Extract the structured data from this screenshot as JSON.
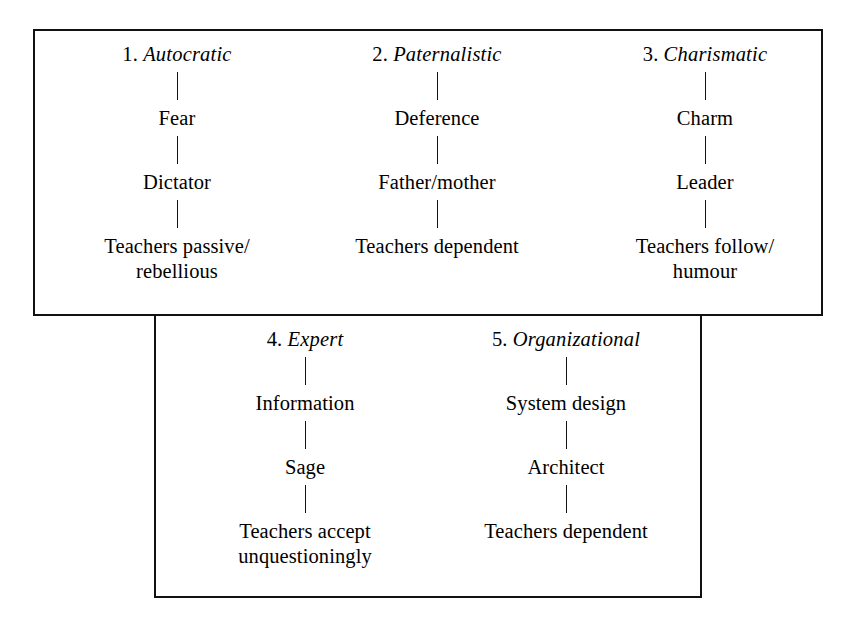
{
  "figure": {
    "kind": "leadership-styles-flow-diagram",
    "ink_color": "#111111",
    "background_color": "#ffffff"
  },
  "boxes": {
    "upper": {
      "name": "upper-group-box"
    },
    "lower": {
      "name": "lower-group-box"
    }
  },
  "columns": [
    {
      "id": "col-1",
      "group": "upper",
      "number": "1.",
      "name": "Autocratic",
      "nodes": [
        "Fear",
        "Dictator",
        "Teachers passive/\nrebellious"
      ]
    },
    {
      "id": "col-2",
      "group": "upper",
      "number": "2.",
      "name": "Paternalistic",
      "nodes": [
        "Deference",
        "Father/mother",
        "Teachers dependent"
      ]
    },
    {
      "id": "col-3",
      "group": "upper",
      "number": "3.",
      "name": "Charismatic",
      "nodes": [
        "Charm",
        "Leader",
        "Teachers follow/\nhumour"
      ]
    },
    {
      "id": "col-4",
      "group": "lower",
      "number": "4.",
      "name": "Expert",
      "nodes": [
        "Information",
        "Sage",
        "Teachers accept\nunquestioningly"
      ]
    },
    {
      "id": "col-5",
      "group": "lower",
      "number": "5.",
      "name": "Organizational",
      "nodes": [
        "System design",
        "Architect",
        "Teachers dependent"
      ]
    }
  ]
}
